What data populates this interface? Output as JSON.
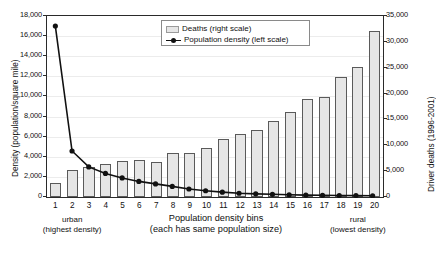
{
  "chart_data": {
    "type": "bar",
    "title": "",
    "subtitle": "",
    "xlabel": "Population density bins",
    "xlabel_sub": "(each has same population size)",
    "grid": true,
    "legend_position": "top-center-inside",
    "categories": [
      "1",
      "2",
      "3",
      "4",
      "5",
      "6",
      "7",
      "8",
      "9",
      "10",
      "11",
      "12",
      "13",
      "14",
      "15",
      "16",
      "17",
      "18",
      "19",
      "20"
    ],
    "left_axis": {
      "label": "Density (population/square mile)",
      "ylim": [
        0,
        18000
      ],
      "ticks": [
        "0",
        "2,000",
        "4,000",
        "6,000",
        "8,000",
        "10,000",
        "12,000",
        "14,000",
        "16,000",
        "18,000"
      ],
      "tick_values": [
        0,
        2000,
        4000,
        6000,
        8000,
        10000,
        12000,
        14000,
        16000,
        18000
      ]
    },
    "right_axis": {
      "label": "Driver deaths (1996-2001)",
      "ylim": [
        0,
        35000
      ],
      "ticks": [
        "0",
        "5,000",
        "10,000",
        "15,000",
        "20,000",
        "25,000",
        "30,000",
        "35,000"
      ],
      "tick_values": [
        0,
        5000,
        10000,
        15000,
        20000,
        25000,
        30000,
        35000
      ]
    },
    "series": [
      {
        "name": "Deaths (right scale)",
        "type": "bar",
        "axis": "right",
        "color": "#e6e6e6",
        "edge_color": "#5a5a5a",
        "values": [
          2800,
          5200,
          5900,
          6300,
          6900,
          7200,
          6800,
          8600,
          8500,
          9400,
          11200,
          12200,
          13000,
          14800,
          16500,
          19000,
          19300,
          23300,
          25200,
          32200
        ]
      },
      {
        "name": "Population density (left scale)",
        "type": "line",
        "axis": "left",
        "color": "#111111",
        "marker": "circle",
        "values": [
          17000,
          4500,
          2900,
          2250,
          1800,
          1450,
          1200,
          950,
          700,
          520,
          380,
          270,
          210,
          160,
          120,
          80,
          60,
          40,
          25,
          15
        ]
      }
    ],
    "annotations": [
      {
        "name": "urban-annotation",
        "line1": "urban",
        "line2": "(highest density)",
        "near_category": "2"
      },
      {
        "name": "rural-annotation",
        "line1": "rural",
        "line2": "(lowest density)",
        "near_category": "19"
      }
    ]
  }
}
